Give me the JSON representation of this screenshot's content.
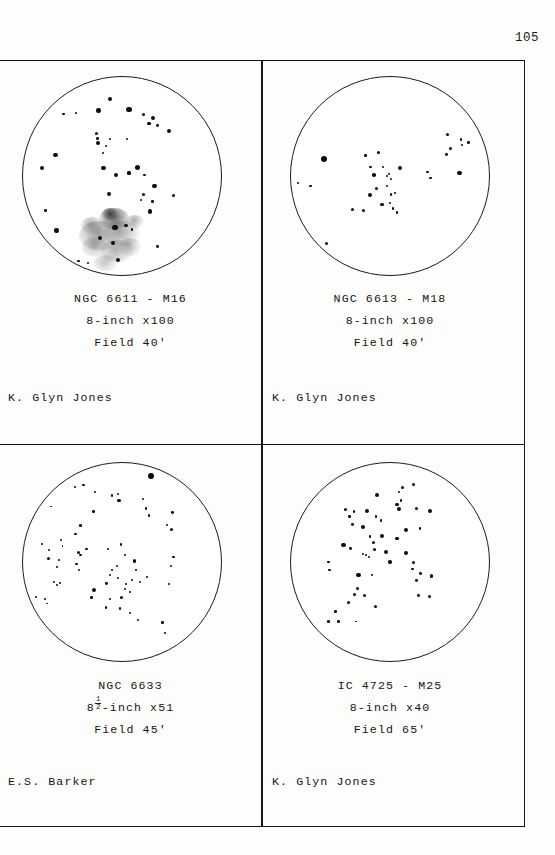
{
  "page": {
    "number": "105",
    "background_color": "#fdfdfc",
    "ink_color": "#151515"
  },
  "panels": [
    {
      "id": "ngc-6611-m16",
      "object_line": "NGC 6611 - M16",
      "instrument_line": "8-inch x100",
      "field_line": "Field 40'",
      "observer": "K. Glyn Jones",
      "has_nebula": true
    },
    {
      "id": "ngc-6613-m18",
      "object_line": "NGC 6613 - M18",
      "instrument_line": "8-inch x100",
      "field_line": "Field 40'",
      "observer": "K. Glyn Jones",
      "has_nebula": false
    },
    {
      "id": "ngc-6633",
      "object_line": "NGC 6633",
      "instrument_prefix": "8",
      "instrument_fraction_num": "1",
      "instrument_fraction_den": "2",
      "instrument_suffix": "-inch x51",
      "field_line": "Field 45'",
      "observer": "E.S. Barker",
      "has_nebula": false
    },
    {
      "id": "ic-4725-m25",
      "object_line": "IC 4725 - M25",
      "instrument_line": "8-inch x40",
      "field_line": "Field 65'",
      "observer": "K. Glyn Jones",
      "has_nebula": false
    }
  ],
  "chart_data": [
    {
      "type": "scatter",
      "title": "NGC 6611 - M16",
      "panel": "top-left",
      "xlabel": "",
      "ylabel": "",
      "xlim": [
        0,
        200
      ],
      "ylim": [
        0,
        200
      ],
      "grid": false,
      "legend": null,
      "note": "Star field drawing; x,y in circle-local px from top-left of the 200x200 field, r = dot radius px",
      "stars": [
        [
          88,
          22,
          2.2
        ],
        [
          107,
          33,
          2.6
        ],
        [
          76,
          34,
          2.3
        ],
        [
          54,
          36,
          1.0
        ],
        [
          41,
          37,
          1.1
        ],
        [
          122,
          38,
          1.5
        ],
        [
          131,
          41,
          2.0
        ],
        [
          127,
          47,
          1.9
        ],
        [
          136,
          49,
          1.4
        ],
        [
          147,
          55,
          2.0
        ],
        [
          74,
          57,
          1.7
        ],
        [
          75,
          62,
          1.3
        ],
        [
          88,
          63,
          1.1
        ],
        [
          105,
          63,
          1.0
        ],
        [
          76,
          67,
          2.1
        ],
        [
          84,
          70,
          1.0
        ],
        [
          33,
          79,
          2.2
        ],
        [
          81,
          77,
          1.0
        ],
        [
          19,
          92,
          2.1
        ],
        [
          81,
          92,
          2.4
        ],
        [
          94,
          99,
          2.1
        ],
        [
          116,
          91,
          2.5
        ],
        [
          107,
          97,
          1.6
        ],
        [
          123,
          99,
          1.4
        ],
        [
          133,
          110,
          2.4
        ],
        [
          87,
          118,
          2.2
        ],
        [
          122,
          119,
          1.5
        ],
        [
          152,
          120,
          1.6
        ],
        [
          119,
          124,
          1.2
        ],
        [
          131,
          126,
          1.3
        ],
        [
          23,
          135,
          1.3
        ],
        [
          128,
          136,
          2.2
        ],
        [
          34,
          155,
          2.2
        ],
        [
          93,
          152,
          2.6
        ],
        [
          104,
          150,
          1.6
        ],
        [
          110,
          154,
          1.3
        ],
        [
          78,
          163,
          2.1
        ],
        [
          91,
          168,
          2.1
        ],
        [
          136,
          171,
          1.4
        ],
        [
          96,
          185,
          2.0
        ],
        [
          56,
          186,
          1.2
        ],
        [
          66,
          188,
          1.1
        ]
      ],
      "nebula_patches": [
        [
          92,
          143,
          30,
          22,
          0.85
        ],
        [
          78,
          160,
          42,
          30,
          0.7
        ],
        [
          100,
          158,
          38,
          26,
          0.62
        ],
        [
          95,
          176,
          34,
          22,
          0.58
        ],
        [
          70,
          150,
          22,
          18,
          0.55
        ],
        [
          113,
          146,
          18,
          14,
          0.6
        ],
        [
          88,
          138,
          16,
          12,
          0.9
        ],
        [
          73,
          172,
          26,
          20,
          0.48
        ],
        [
          108,
          172,
          22,
          18,
          0.5
        ],
        [
          84,
          188,
          26,
          16,
          0.42
        ]
      ]
    },
    {
      "type": "scatter",
      "title": "NGC 6613 - M18",
      "panel": "top-right",
      "xlabel": "",
      "ylabel": "",
      "xlim": [
        0,
        200
      ],
      "ylim": [
        0,
        200
      ],
      "grid": false,
      "legend": null,
      "stars": [
        [
          158,
          58,
          1.5
        ],
        [
          172,
          63,
          1.2
        ],
        [
          179,
          66,
          1.3
        ],
        [
          173,
          69,
          1.0
        ],
        [
          161,
          72,
          1.6
        ],
        [
          157,
          78,
          1.4
        ],
        [
          33,
          83,
          3.0
        ],
        [
          75,
          79,
          1.3
        ],
        [
          88,
          76,
          1.6
        ],
        [
          80,
          91,
          1.4
        ],
        [
          93,
          91,
          1.2
        ],
        [
          110,
          92,
          2.2
        ],
        [
          84,
          99,
          1.8
        ],
        [
          97,
          100,
          1.4
        ],
        [
          99,
          98,
          1.1
        ],
        [
          101,
          103,
          1.2
        ],
        [
          138,
          96,
          1.3
        ],
        [
          141,
          102,
          1.3
        ],
        [
          170,
          97,
          2.3
        ],
        [
          7,
          107,
          1.1
        ],
        [
          20,
          110,
          1.4
        ],
        [
          86,
          113,
          1.6
        ],
        [
          97,
          110,
          1.3
        ],
        [
          80,
          119,
          2.2
        ],
        [
          101,
          119,
          1.4
        ],
        [
          105,
          117,
          1.2
        ],
        [
          92,
          129,
          1.6
        ],
        [
          62,
          134,
          1.5
        ],
        [
          73,
          135,
          1.6
        ],
        [
          100,
          127,
          1.2
        ],
        [
          103,
          133,
          1.3
        ],
        [
          107,
          137,
          1.2
        ],
        [
          36,
          168,
          1.5
        ]
      ],
      "nebula_patches": []
    },
    {
      "type": "scatter",
      "title": "NGC 6633",
      "panel": "bottom-left",
      "xlabel": "",
      "ylabel": "",
      "xlim": [
        0,
        200
      ],
      "ylim": [
        0,
        200
      ],
      "grid": false,
      "legend": null,
      "stars": [
        [
          129,
          13,
          3.2
        ],
        [
          61,
          22,
          1.2
        ],
        [
          53,
          24,
          1.0
        ],
        [
          73,
          29,
          1.1
        ],
        [
          90,
          33,
          1.2
        ],
        [
          96,
          31,
          1.0
        ],
        [
          28,
          44,
          0.9
        ],
        [
          97,
          38,
          1.7
        ],
        [
          121,
          36,
          1.0
        ],
        [
          71,
          49,
          1.3
        ],
        [
          124,
          46,
          1.1
        ],
        [
          127,
          53,
          1.2
        ],
        [
          151,
          50,
          1.4
        ],
        [
          58,
          63,
          1.2
        ],
        [
          145,
          63,
          1.0
        ],
        [
          150,
          67,
          1.6
        ],
        [
          53,
          72,
          1.1
        ],
        [
          38,
          78,
          1.0
        ],
        [
          19,
          82,
          1.0
        ],
        [
          40,
          84,
          0.9
        ],
        [
          99,
          82,
          1.4
        ],
        [
          26,
          88,
          1.1
        ],
        [
          56,
          90,
          1.6
        ],
        [
          64,
          87,
          1.2
        ],
        [
          86,
          87,
          1.0
        ],
        [
          58,
          93,
          1.3
        ],
        [
          103,
          93,
          1.0
        ],
        [
          26,
          96,
          1.5
        ],
        [
          36,
          98,
          0.9
        ],
        [
          152,
          95,
          1.1
        ],
        [
          113,
          99,
          1.6
        ],
        [
          54,
          102,
          1.2
        ],
        [
          34,
          105,
          0.9
        ],
        [
          57,
          108,
          1.0
        ],
        [
          90,
          108,
          1.2
        ],
        [
          95,
          104,
          1.0
        ],
        [
          114,
          108,
          1.3
        ],
        [
          149,
          104,
          1.0
        ],
        [
          88,
          113,
          1.3
        ],
        [
          96,
          116,
          1.2
        ],
        [
          125,
          115,
          1.2
        ],
        [
          110,
          118,
          1.0
        ],
        [
          31,
          120,
          1.0
        ],
        [
          34,
          123,
          1.1
        ],
        [
          37,
          121,
          0.9
        ],
        [
          84,
          122,
          1.4
        ],
        [
          104,
          122,
          1.0
        ],
        [
          118,
          120,
          1.1
        ],
        [
          147,
          122,
          1.0
        ],
        [
          72,
          128,
          2.1
        ],
        [
          103,
          127,
          1.1
        ],
        [
          108,
          130,
          1.0
        ],
        [
          13,
          135,
          1.0
        ],
        [
          22,
          137,
          1.0
        ],
        [
          69,
          136,
          1.2
        ],
        [
          88,
          137,
          1.1
        ],
        [
          99,
          136,
          1.5
        ],
        [
          24,
          142,
          0.9
        ],
        [
          84,
          146,
          1.2
        ],
        [
          98,
          147,
          1.1
        ],
        [
          108,
          152,
          1.0
        ],
        [
          116,
          159,
          1.1
        ],
        [
          141,
          161,
          1.2
        ],
        [
          143,
          172,
          1.0
        ]
      ],
      "nebula_patches": []
    },
    {
      "type": "scatter",
      "title": "IC 4725 - M25",
      "panel": "bottom-right",
      "xlabel": "",
      "ylabel": "",
      "xlim": [
        0,
        200
      ],
      "ylim": [
        0,
        200
      ],
      "grid": false,
      "legend": null,
      "stars": [
        [
          113,
          25,
          1.5
        ],
        [
          124,
          22,
          1.6
        ],
        [
          109,
          29,
          1.1
        ],
        [
          87,
          32,
          2.1
        ],
        [
          111,
          38,
          1.2
        ],
        [
          107,
          42,
          1.6
        ],
        [
          55,
          47,
          1.5
        ],
        [
          64,
          49,
          1.1
        ],
        [
          77,
          48,
          2.0
        ],
        [
          109,
          46,
          2.0
        ],
        [
          127,
          46,
          1.5
        ],
        [
          140,
          48,
          2.0
        ],
        [
          59,
          54,
          1.2
        ],
        [
          86,
          54,
          1.2
        ],
        [
          91,
          58,
          1.2
        ],
        [
          62,
          62,
          1.4
        ],
        [
          73,
          65,
          2.0
        ],
        [
          130,
          66,
          1.2
        ],
        [
          116,
          68,
          2.0
        ],
        [
          80,
          74,
          1.3
        ],
        [
          92,
          74,
          2.1
        ],
        [
          107,
          76,
          1.6
        ],
        [
          53,
          83,
          2.2
        ],
        [
          60,
          86,
          1.4
        ],
        [
          83,
          80,
          1.5
        ],
        [
          84,
          87,
          1.6
        ],
        [
          96,
          90,
          2.4
        ],
        [
          116,
          91,
          2.3
        ],
        [
          73,
          92,
          1.0
        ],
        [
          76,
          93,
          1.1
        ],
        [
          79,
          95,
          1.0
        ],
        [
          38,
          100,
          1.4
        ],
        [
          100,
          100,
          1.8
        ],
        [
          124,
          101,
          1.5
        ],
        [
          39,
          108,
          1.4
        ],
        [
          123,
          107,
          1.3
        ],
        [
          68,
          113,
          2.3
        ],
        [
          82,
          113,
          1.1
        ],
        [
          131,
          112,
          1.4
        ],
        [
          142,
          114,
          1.7
        ],
        [
          127,
          119,
          1.4
        ],
        [
          67,
          127,
          1.7
        ],
        [
          64,
          133,
          1.6
        ],
        [
          74,
          134,
          1.5
        ],
        [
          129,
          134,
          1.4
        ],
        [
          140,
          135,
          1.8
        ],
        [
          58,
          141,
          1.5
        ],
        [
          85,
          145,
          1.6
        ],
        [
          45,
          150,
          1.2
        ],
        [
          38,
          160,
          1.3
        ],
        [
          48,
          160,
          1.2
        ],
        [
          66,
          160,
          0.9
        ]
      ],
      "nebula_patches": []
    }
  ]
}
